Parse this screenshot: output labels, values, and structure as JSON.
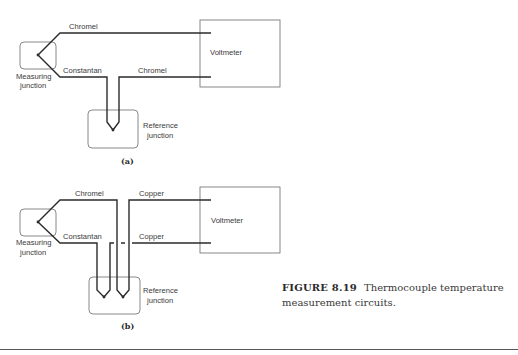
{
  "figure": {
    "number_label": "FIGURE 8.19",
    "caption_line1": "Thermocouple temperature",
    "caption_line2": "measurement circuits."
  },
  "panel_a": {
    "sublabel": "(a)",
    "wires": {
      "top": "Chromel",
      "bottom_left": "Constantan",
      "bottom_right": "Chromel"
    },
    "measuring_junction": [
      "Measuring",
      "junction"
    ],
    "reference_junction": [
      "Reference",
      "junction"
    ],
    "meter": "Voltmeter"
  },
  "panel_b": {
    "sublabel": "(b)",
    "wires": {
      "top_left": "Chromel",
      "top_right": "Copper",
      "bottom_left": "Constantan",
      "bottom_right": "Copper"
    },
    "measuring_junction": [
      "Measuring",
      "junction"
    ],
    "reference_junction": [
      "Reference",
      "junction"
    ],
    "meter": "Voltmeter"
  },
  "colors": {
    "wire": "#2b2b2b",
    "box_outline": "#7a7a7a",
    "text": "#3a3a3a"
  }
}
